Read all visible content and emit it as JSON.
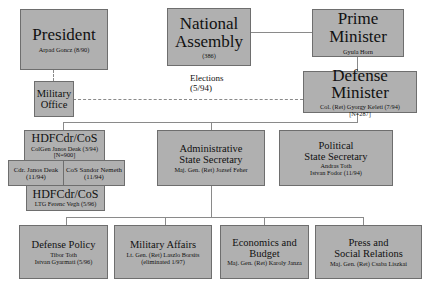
{
  "top": {
    "president": {
      "title": "President",
      "name": "Arpad Goncz (8/90)"
    },
    "national_assembly": {
      "title_line1": "National",
      "title_line2": "Assembly",
      "seats": "(386)"
    },
    "prime_minister": {
      "title": "Prime Minister",
      "name": "Gyula Horn"
    }
  },
  "elections_label": {
    "line1": "Elections",
    "line2": "(5/94)"
  },
  "defense_minister": {
    "title": "Defense Minister",
    "name": "Col. (Ret) Gyorgy Keleti (7/94)",
    "staff": "[N=287]"
  },
  "military_office": {
    "line1": "Military",
    "line2": "Office"
  },
  "hdf": {
    "cdr_cos": {
      "title": "HDFCdr/CoS",
      "name": "ColGen Janos Deak (3/94)",
      "staff": "[N=900]"
    },
    "cdr": {
      "name": "Cdr. Janos Deak",
      "date": "(11/94)"
    },
    "cos": {
      "name": "CoS Sandor Nemeth",
      "date": "(11/94)"
    },
    "cdr_cos_2": {
      "title": "HDFCdr/CoS",
      "name": "LTG Ferenc Vegh (5/96)"
    }
  },
  "admin_secretary": {
    "line1": "Administrative",
    "line2": "State Secretary",
    "name": "Maj. Gen. (Ret) Jozsef Feher"
  },
  "political_secretary": {
    "line1": "Political",
    "line2": "State Secretary",
    "name1": "Andras Toth",
    "name2": "Istvan Fodor (11/94)"
  },
  "departments": [
    {
      "line1": "Defense Policy",
      "line2": "",
      "name1": "Tibor Toth",
      "name2": "Istvan Gyarmati (5/96)"
    },
    {
      "line1": "Military Affairs",
      "line2": "",
      "name1": "Lt. Gen. (Ret) Laszlo Borsits",
      "name2": "(eliminated 1/97)"
    },
    {
      "line1": "Economics and",
      "line2": "Budget",
      "name1": "Maj. Gen. (Ret) Karoly Janza",
      "name2": ""
    },
    {
      "line1": "Press and",
      "line2": "Social Relations",
      "name1": "Maj. Gen. (Ret) Csaba Liszkai",
      "name2": ""
    }
  ],
  "colors": {
    "box_fill": "#b0b0b0",
    "box_border": "#6e6e6e",
    "connector": "#8a8a8a"
  }
}
